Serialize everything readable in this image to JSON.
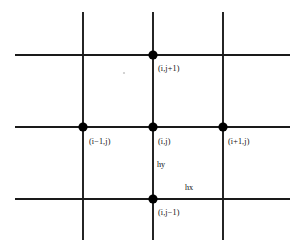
{
  "diagram": {
    "kind": "finite-difference-stencil",
    "background_color": "#ffffff",
    "line_color": "#1a1a1a",
    "node_color": "#000000",
    "canvas": {
      "width": 304,
      "height": 252
    },
    "grid": {
      "vertical_lines_x": [
        83,
        153,
        223
      ],
      "vertical_extent_y": [
        12,
        240
      ],
      "horizontal_lines_y": [
        55,
        127,
        199
      ],
      "horizontal_extent_x": [
        15,
        290
      ],
      "line_width": 1.9
    },
    "nodes": [
      {
        "id": "north",
        "label": "(i,j+1)",
        "x": 153,
        "y": 55,
        "radius": 4.6,
        "label_x": 158,
        "label_y": 65
      },
      {
        "id": "west",
        "label": "(i−1,j)",
        "x": 83,
        "y": 127,
        "radius": 4.6,
        "label_x": 89,
        "label_y": 138
      },
      {
        "id": "center",
        "label": "(i,j)",
        "x": 153,
        "y": 127,
        "radius": 4.6,
        "label_x": 158,
        "label_y": 138
      },
      {
        "id": "east",
        "label": "(i+1,j)",
        "x": 223,
        "y": 127,
        "radius": 4.6,
        "label_x": 228,
        "label_y": 138
      },
      {
        "id": "south",
        "label": "(i,j−1)",
        "x": 153,
        "y": 199,
        "radius": 4.6,
        "label_x": 158,
        "label_y": 209
      }
    ],
    "spacing_labels": [
      {
        "id": "hy",
        "label": "hy",
        "x": 157,
        "y": 161
      },
      {
        "id": "hx",
        "label": "hx",
        "x": 185,
        "y": 184
      }
    ],
    "artifact": {
      "x": 124,
      "y": 73,
      "radius": 1.1
    }
  }
}
